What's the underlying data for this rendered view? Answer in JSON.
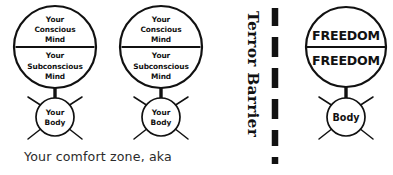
{
  "diagram": {
    "title_caption": "Your comfort zone, aka",
    "barrier": {
      "label": "Terror Barrier",
      "style": "dashed-vertical-line",
      "dash_color": "#111111"
    },
    "stroke_color": "#111111",
    "background_color": "#ffffff",
    "figures": [
      {
        "id": "figure-left",
        "side": "inside-comfort-zone",
        "head": {
          "upper_label": "Your\nConscious\nMind",
          "upper_lines": [
            "Your",
            "Conscious",
            "Mind"
          ],
          "lower_label": "Your\nSubconscious\nMind",
          "lower_lines": [
            "Your",
            "Subconscious",
            "Mind"
          ]
        },
        "body": {
          "lines": [
            "Your",
            "Body"
          ]
        }
      },
      {
        "id": "figure-middle",
        "side": "inside-comfort-zone",
        "head": {
          "upper_lines": [
            "Your",
            "Conscious",
            "Mind"
          ],
          "lower_lines": [
            "Your",
            "Subconscious",
            "Mind"
          ]
        },
        "body": {
          "lines": [
            "Your",
            "Body"
          ]
        }
      },
      {
        "id": "figure-right",
        "side": "beyond-terror-barrier",
        "head": {
          "upper_lines": [
            "FREEDOM"
          ],
          "lower_lines": [
            "FREEDOM"
          ]
        },
        "body": {
          "lines": [
            "Body"
          ]
        }
      }
    ]
  }
}
